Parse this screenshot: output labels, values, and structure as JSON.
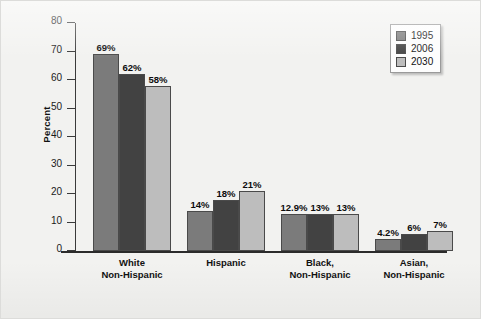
{
  "chart_data": {
    "type": "bar",
    "title": "",
    "xlabel": "",
    "ylabel": "Percent",
    "ylim": [
      0,
      80
    ],
    "yticks": [
      0,
      10,
      20,
      30,
      40,
      50,
      60,
      70,
      80
    ],
    "grid": false,
    "legend_position": "top-right",
    "categories": [
      "White\nNon-Hispanic",
      "Hispanic",
      "Black,\nNon-Hispanic",
      "Asian,\nNon-Hispanic"
    ],
    "category_lines": [
      [
        "White",
        "Non-Hispanic"
      ],
      [
        "Hispanic",
        ""
      ],
      [
        "Black,",
        "Non-Hispanic"
      ],
      [
        "Asian,",
        "Non-Hispanic"
      ]
    ],
    "series": [
      {
        "name": "1995",
        "color": "#7b7b7b",
        "values": [
          69,
          14,
          12.9,
          4.2
        ],
        "labels": [
          "69%",
          "14%",
          "12.9%",
          "4.2%"
        ]
      },
      {
        "name": "2006",
        "color": "#424242",
        "values": [
          62,
          18,
          13,
          6
        ],
        "labels": [
          "62%",
          "18%",
          "13%",
          "6%"
        ]
      },
      {
        "name": "2030",
        "color": "#bdbdbd",
        "values": [
          58,
          21,
          13,
          7
        ],
        "labels": [
          "58%",
          "21%",
          "13%",
          "7%"
        ]
      }
    ]
  },
  "legend": {
    "entries": [
      {
        "label": "1995",
        "color": "#7b7b7b"
      },
      {
        "label": "2006",
        "color": "#424242"
      },
      {
        "label": "2030",
        "color": "#bdbdbd"
      }
    ]
  },
  "axes": {
    "y_label": "Percent",
    "y_tick_labels": [
      "80",
      "70",
      "60",
      "50",
      "40",
      "30",
      "20",
      "10",
      "0"
    ]
  }
}
